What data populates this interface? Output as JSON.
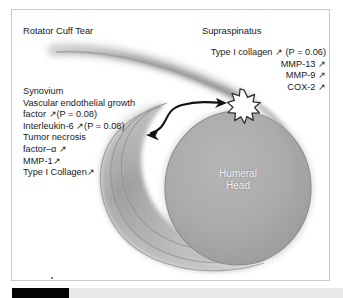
{
  "figure": {
    "title_left": "Rotator Cuff Tear",
    "title_right": "Supraspinatus",
    "center_label_line1": "Humeral",
    "center_label_line2": "Head",
    "arrow_up": "↗",
    "colors": {
      "humeral_head_fill": "#a9a9a9",
      "humeral_head_stroke": "#8a8a8a",
      "tendon_band": "#b4b4b4",
      "capsule_arc": "#9c9c9c",
      "burst_fill": "#fdfdfd",
      "burst_stroke": "#2b2b2b",
      "text": "#1a1a1a",
      "frame_border": "#c9c9c9",
      "center_label_text": "#f0f0f0",
      "bottom_bar_dark": "#050505",
      "bottom_bar_light": "#e9e9e9"
    }
  },
  "supraspinatus_findings": [
    {
      "name": "Type I collagen",
      "trend": "↗",
      "pvalue": "(P = 0.06)"
    },
    {
      "name": "MMP-13",
      "trend": "↗",
      "pvalue": ""
    },
    {
      "name": "MMP-9",
      "trend": "↗",
      "pvalue": ""
    },
    {
      "name": "COX-2",
      "trend": "↗",
      "pvalue": ""
    }
  ],
  "supraspinatus_lines": [
    "Type I collagen ↗ (P = 0.06)",
    "MMP-13 ↗",
    "MMP-9 ↗",
    "COX-2 ↗"
  ],
  "synovium_heading": "Synovium",
  "synovium_findings": [
    {
      "name": "Vascular endothelial growth",
      "trend": "",
      "pvalue": ""
    },
    {
      "name": "factor",
      "trend": "↗",
      "pvalue": "(P = 0.08)"
    },
    {
      "name": "Interleukin-6",
      "trend": "↗",
      "pvalue": "(P = 0.08)"
    },
    {
      "name": "Tumor necrosis",
      "trend": "",
      "pvalue": ""
    },
    {
      "name": "factor–α",
      "trend": "↗",
      "pvalue": ""
    },
    {
      "name": "MMP-1",
      "trend": "↗",
      "pvalue": ""
    },
    {
      "name": "Type I Collagen",
      "trend": "↗",
      "pvalue": ""
    }
  ],
  "synovium_lines": [
    "Synovium",
    "Vascular endothelial growth",
    "factor  ↗(P = 0.08)",
    "Interleukin-6 ↗(P = 0.08)",
    "Tumor necrosis",
    "factor–α ↗",
    "MMP-1↗",
    "Type I Collagen↗"
  ]
}
